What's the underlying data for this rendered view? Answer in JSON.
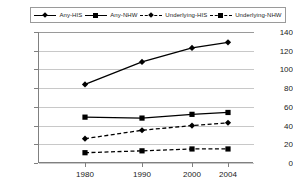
{
  "chart_data": {
    "type": "line",
    "title": "",
    "xlabel": "",
    "ylabel": "",
    "categories": [
      "1980",
      "1990",
      "2000",
      "2004"
    ],
    "ylim": [
      0,
      140
    ],
    "yticks": [
      0,
      20,
      40,
      60,
      80,
      100,
      120,
      140
    ],
    "grid": "horizontal",
    "legend_position": "top",
    "series": [
      {
        "name": "Any-HIS",
        "values": [
          84,
          108,
          123,
          129
        ],
        "marker": "diamond",
        "line_style": "solid",
        "color": "#000000"
      },
      {
        "name": "Any-NHW",
        "values": [
          49,
          48,
          52,
          54
        ],
        "marker": "square",
        "line_style": "solid",
        "color": "#000000"
      },
      {
        "name": "Underlying-HIS",
        "values": [
          26,
          35,
          40,
          43
        ],
        "marker": "diamond",
        "line_style": "dashed",
        "color": "#000000"
      },
      {
        "name": "Underlying-NHW",
        "values": [
          11,
          13,
          15,
          15
        ],
        "marker": "square",
        "line_style": "dashed",
        "color": "#000000"
      }
    ]
  },
  "legend": {
    "items": [
      {
        "label": "Any-HIS",
        "marker": "diamond",
        "line_style": "solid"
      },
      {
        "label": "Any-NHW",
        "marker": "square",
        "line_style": "solid"
      },
      {
        "label": "Underlying-HIS",
        "marker": "diamond",
        "line_style": "dashed"
      },
      {
        "label": "Underlying-NHW",
        "marker": "square",
        "line_style": "dashed"
      }
    ]
  },
  "axes": {
    "y_tick_labels": [
      "140",
      "120",
      "100",
      "80",
      "60",
      "40",
      "20",
      "0"
    ],
    "x_tick_labels": [
      "1980",
      "1990",
      "2000",
      "2004"
    ]
  },
  "colors": {
    "series": "#000000",
    "gridline": "#c8c8c8",
    "axis": "#808080",
    "legend_border": "#9a9a9a",
    "background": "#ffffff",
    "text": "#1a1a1a"
  }
}
